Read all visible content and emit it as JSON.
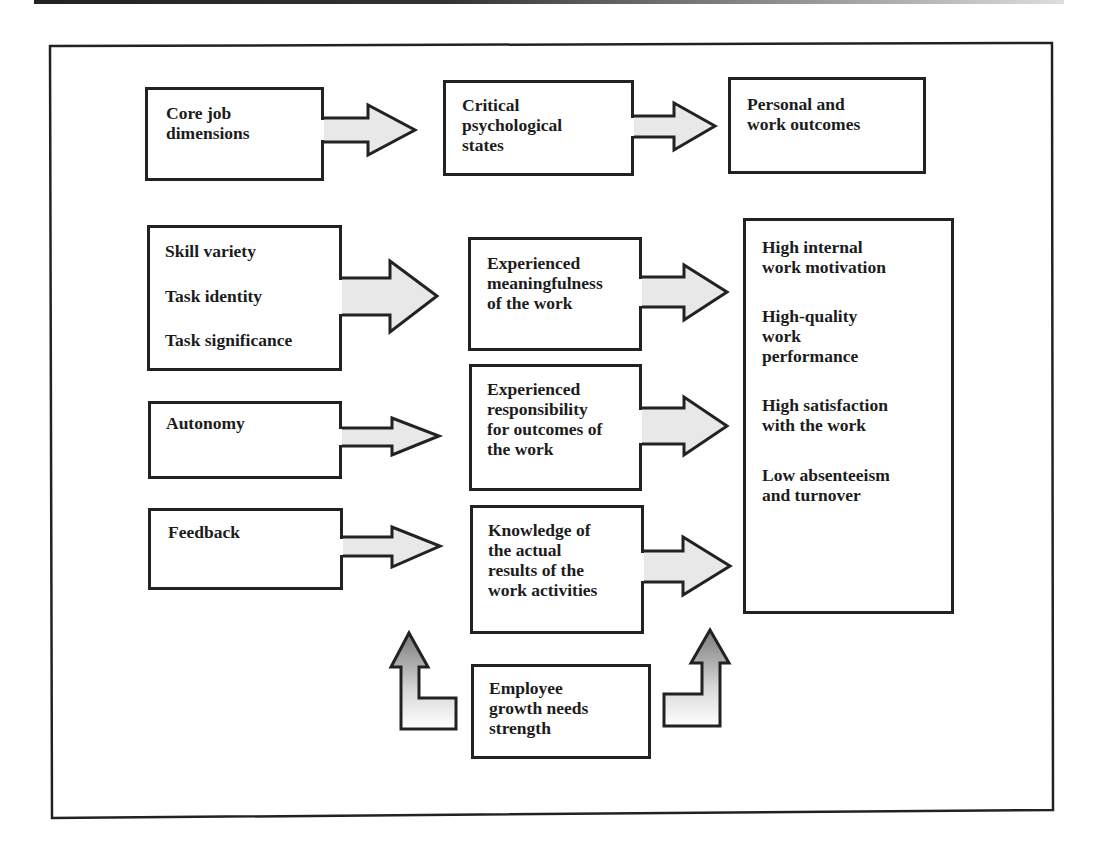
{
  "diagram": {
    "header_row": {
      "core": "Core job\ndimensions",
      "critical": "Critical\npsychological\nstates",
      "outcomes": "Personal and\nwork outcomes"
    },
    "core_dimensions": {
      "group1": [
        "Skill variety",
        "Task identity",
        "Task significance"
      ],
      "autonomy": "Autonomy",
      "feedback": "Feedback"
    },
    "psychological_states": {
      "meaningfulness": "Experienced\nmeaningfulness\nof the work",
      "responsibility": "Experienced\nresponsibility\nfor outcomes of\nthe work",
      "knowledge": "Knowledge of\nthe actual\nresults of the\nwork activities"
    },
    "outcomes": [
      "High internal\nwork motivation",
      "High-quality\nwork\nperformance",
      "High satisfaction\nwith the work",
      "Low absenteeism\nand turnover"
    ],
    "moderator": "Employee\ngrowth needs\nstrength",
    "colors": {
      "line": "#222222",
      "arrow_fill": "#e6e6e6",
      "up_arrow_fill_top": "#8a8a8a",
      "background": "#ffffff"
    }
  }
}
